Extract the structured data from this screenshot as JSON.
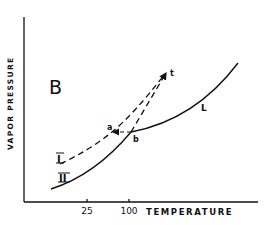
{
  "figure": {
    "panel_label": "B",
    "y_axis_label": "VAPOR PRESSURE",
    "x_axis_label": "TEMPERATURE",
    "x_ticks": [
      {
        "label": "25",
        "x": 87
      },
      {
        "label": "100",
        "x": 129
      }
    ],
    "curves": [
      {
        "id": "I",
        "label": "I",
        "style": "dashed",
        "description": "vapor pressure curve of form I (metastable)"
      },
      {
        "id": "II",
        "label": "II",
        "style": "solid",
        "description": "vapor pressure curve of form II"
      },
      {
        "id": "L",
        "label": "L",
        "style": "solid",
        "description": "liquid vapor pressure curve"
      }
    ],
    "points": [
      {
        "label": "a"
      },
      {
        "label": "b"
      },
      {
        "label": "t"
      }
    ],
    "line_color": "#111111",
    "background": "#ffffff"
  }
}
